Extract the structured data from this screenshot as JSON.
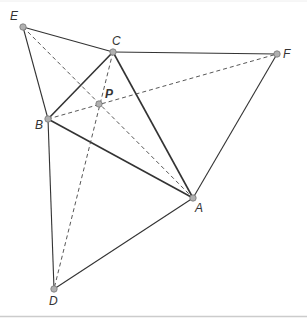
{
  "diagram": {
    "title": "",
    "points": {
      "A": {
        "label": "A",
        "x": 193,
        "y": 198
      },
      "B": {
        "label": "B",
        "x": 48,
        "y": 119
      },
      "C": {
        "label": "C",
        "x": 113,
        "y": 52
      },
      "D": {
        "label": "D",
        "x": 54,
        "y": 289
      },
      "E": {
        "label": "E",
        "x": 23,
        "y": 27
      },
      "F": {
        "label": "F",
        "x": 277,
        "y": 54
      },
      "P": {
        "label": "P",
        "x": 99,
        "y": 104
      }
    },
    "solid_segments": [
      [
        "A",
        "B"
      ],
      [
        "B",
        "C"
      ],
      [
        "C",
        "A"
      ],
      [
        "E",
        "C"
      ],
      [
        "E",
        "B"
      ],
      [
        "C",
        "F"
      ],
      [
        "F",
        "A"
      ],
      [
        "B",
        "D"
      ],
      [
        "D",
        "A"
      ]
    ],
    "dashed_segments": [
      [
        "E",
        "A"
      ],
      [
        "B",
        "F"
      ],
      [
        "C",
        "D"
      ]
    ],
    "colors": {
      "line": "#333333",
      "point_fill": "#b0b0b0",
      "point_stroke": "#777777",
      "border": "#cccccc"
    }
  }
}
